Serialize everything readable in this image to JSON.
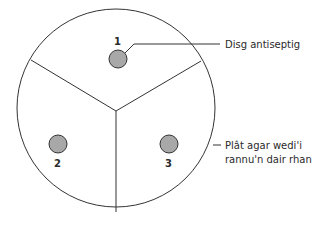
{
  "diagram": {
    "discs": [
      {
        "label": "1",
        "cx": 118,
        "cy": 58
      },
      {
        "label": "2",
        "cx": 58,
        "cy": 144
      },
      {
        "label": "3",
        "cx": 169,
        "cy": 144
      }
    ],
    "callouts": {
      "disc": "Disg antiseptig",
      "plate_line1": "Plât agar wedi'i",
      "plate_line2": "rannu'n dair rhan"
    },
    "colors": {
      "disc_fill": "#a8a8a8",
      "stroke": "#333333"
    }
  }
}
